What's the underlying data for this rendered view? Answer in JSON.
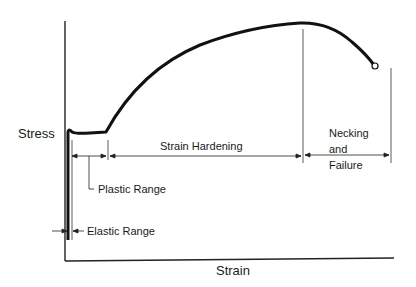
{
  "axes": {
    "y_label": "Stress",
    "x_label": "Strain"
  },
  "regions": [
    {
      "label": "Elastic Range"
    },
    {
      "label": "Plastic Range"
    },
    {
      "label": "Strain Hardening"
    },
    {
      "label": "Necking and Failure",
      "lines": [
        "Necking",
        "and",
        "Failure"
      ]
    }
  ],
  "colors": {
    "line": "#111111",
    "background": "#ffffff"
  }
}
